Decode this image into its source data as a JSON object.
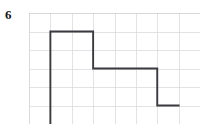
{
  "figure": {
    "problem_number": "6",
    "type": "square-wave-on-grid",
    "line_color": "#3a3a40",
    "grid_color": "#d7d7da",
    "background_color": "#ffffff"
  },
  "chart_data": {
    "type": "line",
    "title": "",
    "subtitle": "",
    "xlabel": "",
    "ylabel": "",
    "grid": true,
    "legend": null,
    "legend_position": "none",
    "columns": 8,
    "rows": 6,
    "cell_width_units": 1,
    "cell_height_units": 1,
    "xlim": [
      0,
      8
    ],
    "ylim": [
      0,
      6
    ],
    "xticks": [
      0,
      1,
      2,
      3,
      4,
      5,
      6,
      7,
      8
    ],
    "yticks": [
      0,
      1,
      2,
      3,
      4,
      5,
      6
    ],
    "xticklabels": [
      "",
      "",
      "",
      "",
      "",
      "",
      "",
      "",
      ""
    ],
    "yticklabels": [
      "",
      "",
      "",
      "",
      "",
      "",
      ""
    ],
    "series": [
      {
        "name": "waveform",
        "style": "step",
        "color": "#3a3a40",
        "x": [
          1,
          1,
          3,
          3,
          4,
          4,
          6,
          6,
          7
        ],
        "y": [
          0,
          5,
          5,
          3,
          3,
          3,
          3,
          1,
          1
        ],
        "points": [
          {
            "x": 1,
            "y": 0
          },
          {
            "x": 1,
            "y": 5
          },
          {
            "x": 3,
            "y": 5
          },
          {
            "x": 3,
            "y": 3
          },
          {
            "x": 4,
            "y": 3
          },
          {
            "x": 4,
            "y": 3
          },
          {
            "x": 6,
            "y": 3
          },
          {
            "x": 6,
            "y": 1
          },
          {
            "x": 7,
            "y": 1
          }
        ]
      }
    ],
    "annotations": [
      {
        "text": "6",
        "role": "problem-number",
        "x": -1.1,
        "y": 5.6
      }
    ],
    "segments": [
      {
        "kind": "vertical-rise",
        "x": 1,
        "y_from": 0,
        "y_to": 5
      },
      {
        "kind": "horizontal-high",
        "y": 5,
        "x_from": 1,
        "x_to": 3
      },
      {
        "kind": "vertical-fall",
        "x": 3,
        "y_from": 5,
        "y_to": 3
      },
      {
        "kind": "horizontal-mid",
        "y": 3,
        "x_from": 4,
        "x_to": 6
      },
      {
        "kind": "vertical-rise",
        "x": 4,
        "y_from": 1,
        "y_to": 3
      },
      {
        "kind": "vertical-fall",
        "x": 6,
        "y_from": 3,
        "y_to": 1
      },
      {
        "kind": "horizontal-low",
        "y": 1,
        "x_from": 4,
        "x_to": 7
      }
    ]
  }
}
